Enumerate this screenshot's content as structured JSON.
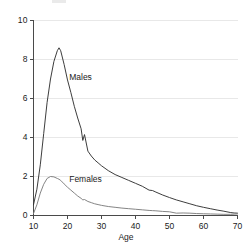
{
  "chart_data": {
    "type": "line",
    "title": "",
    "xlabel": "Age",
    "ylabel": "",
    "xlim": [
      10,
      70
    ],
    "ylim": [
      0,
      10
    ],
    "xticks": [
      10,
      20,
      30,
      40,
      50,
      60,
      70
    ],
    "yticks": [
      0,
      2,
      4,
      6,
      8,
      10
    ],
    "xtick_labels": [
      "10",
      "20",
      "30",
      "40",
      "50",
      "60",
      "70"
    ],
    "ytick_labels": [
      "0",
      "2",
      "4",
      "6",
      "8",
      "10"
    ],
    "grid": "horizontal",
    "legend_position": "inline-annotation",
    "x": [
      10,
      11,
      12,
      13,
      14,
      15,
      16,
      17,
      17.5,
      18,
      19,
      20,
      21,
      22,
      23,
      24,
      24.5,
      25,
      26,
      27,
      28,
      29,
      30,
      32,
      34,
      36,
      38,
      40,
      42,
      44,
      45,
      46,
      48,
      50,
      52,
      54,
      56,
      58,
      60,
      62,
      64,
      66,
      68,
      69,
      70
    ],
    "series": [
      {
        "name": "Males",
        "color": "#333333",
        "label_x": 20.5,
        "label_y": 7.1,
        "values": [
          0.55,
          1.35,
          2.6,
          4.2,
          5.8,
          7.0,
          7.9,
          8.45,
          8.6,
          8.45,
          7.75,
          6.95,
          6.3,
          5.6,
          5.0,
          4.45,
          3.85,
          4.15,
          3.3,
          3.05,
          2.85,
          2.7,
          2.55,
          2.3,
          2.1,
          1.95,
          1.8,
          1.65,
          1.5,
          1.3,
          1.28,
          1.2,
          1.05,
          0.92,
          0.8,
          0.7,
          0.6,
          0.5,
          0.42,
          0.35,
          0.28,
          0.22,
          0.15,
          0.13,
          0.12
        ]
      },
      {
        "name": "Females",
        "color": "#7d7d7d",
        "label_x": 20.5,
        "label_y": 1.85,
        "values": [
          0.1,
          0.55,
          1.15,
          1.6,
          1.9,
          2.0,
          1.98,
          1.9,
          1.86,
          1.8,
          1.62,
          1.45,
          1.3,
          1.15,
          1.0,
          0.88,
          0.8,
          0.82,
          0.72,
          0.66,
          0.6,
          0.56,
          0.52,
          0.46,
          0.42,
          0.38,
          0.35,
          0.32,
          0.29,
          0.26,
          0.25,
          0.24,
          0.21,
          0.19,
          0.12,
          0.13,
          0.12,
          0.1,
          0.09,
          0.08,
          0.07,
          0.06,
          0.06,
          0.07,
          0.08
        ]
      }
    ]
  },
  "axis": {
    "x_title": "Age"
  },
  "colors": {
    "background": "#ffffff",
    "axis_line": "#4a4a4a",
    "gridline": "#e8e8e8",
    "males_line": "#333333",
    "females_line": "#7d7d7d",
    "text": "#1b1b1b"
  }
}
